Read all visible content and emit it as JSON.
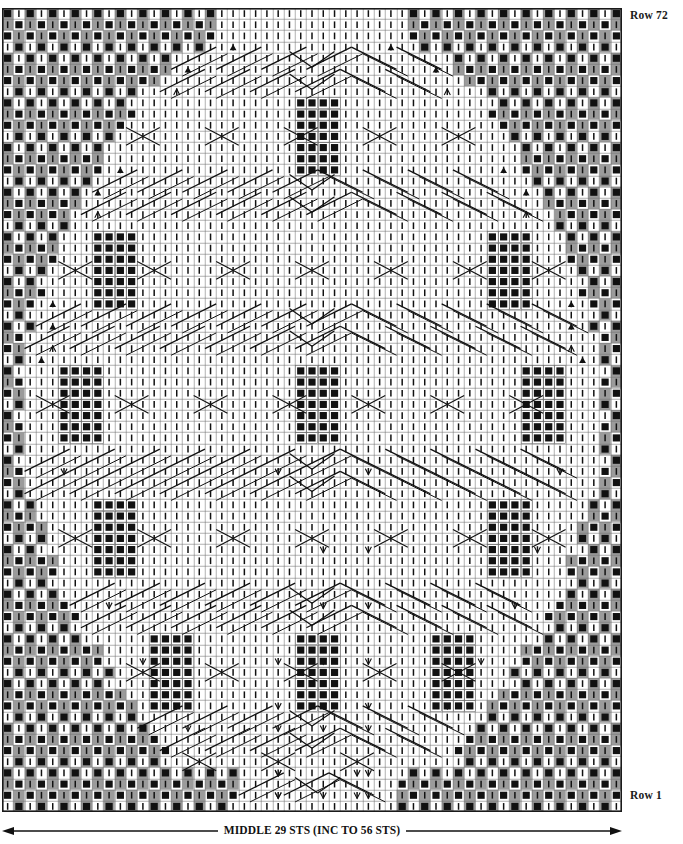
{
  "document": {
    "type": "knitting-stitch-chart",
    "title_visible": false
  },
  "labels": {
    "row_top": "Row 72",
    "row_bottom": "Row 1",
    "caption": "MIDDLE 29 STS (INC TO 56 STS)"
  },
  "colors": {
    "grid_line": "#6e6e6e",
    "grid_border": "#1a1a1a",
    "cell_gray": "#9b9b9b",
    "cell_white": "#ffffff",
    "symbol_black": "#111111",
    "text": "#111111",
    "arrow": "#111111"
  },
  "chart_data": {
    "type": "heatmap",
    "title": "",
    "xlabel": "MIDDLE 29 STS (INC TO 56 STS)",
    "ylabel": "",
    "grid": true,
    "legend_position": "none",
    "columns": 55,
    "rows": 72,
    "cell_width": 11.27,
    "cell_height": 11.17,
    "row_numbering": {
      "bottom_row_label": "Row 1",
      "top_row_label": "Row 72",
      "direction": "bottom-to-top"
    },
    "symbol_key": [
      {
        "code": "knit",
        "glyph": "|",
        "description": "vertical tick - knit stitch on white ground"
      },
      {
        "code": "purl",
        "glyph": "■",
        "description": "filled black square - purl / bobble"
      },
      {
        "code": "dec-left",
        "glyph": "▲",
        "description": "solid triangle - decrease"
      },
      {
        "code": "inc-v",
        "glyph": "V",
        "description": "open V - increase / make one"
      },
      {
        "code": "cable",
        "glyph": "╱╲",
        "description": "diagonal line - cable crossing over cells"
      },
      {
        "code": "blank-gray",
        "glyph": "",
        "description": "gray filled ground cell"
      },
      {
        "code": "blank-white",
        "glyph": "",
        "description": "white ground cell"
      }
    ],
    "regions": [
      {
        "name": "left-border-checker",
        "description": "alternating gray/white columns with offset black squares and knit ticks"
      },
      {
        "name": "right-border-checker",
        "description": "mirror of left border"
      },
      {
        "name": "center-panel",
        "description": "white ground with knit ticks, cable diagonals, purl blocks"
      },
      {
        "name": "purl-blocks",
        "description": "4 wide x 7 tall blocks of black squares repeated symmetrically"
      }
    ],
    "arrow": {
      "style": "double-headed",
      "span_columns": 55
    }
  }
}
